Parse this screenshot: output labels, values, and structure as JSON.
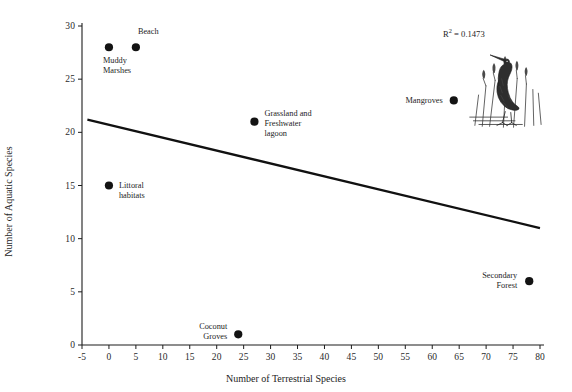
{
  "chart_data": {
    "type": "scatter",
    "title": "",
    "xlabel": "Number of Terrestrial Species",
    "ylabel": "Number of Aquatic Species",
    "xlim": [
      -5,
      80
    ],
    "ylim": [
      0,
      30
    ],
    "xticks": [
      -5,
      0,
      5,
      10,
      15,
      20,
      25,
      30,
      35,
      40,
      45,
      50,
      55,
      60,
      65,
      70,
      75,
      80
    ],
    "yticks": [
      0,
      5,
      10,
      15,
      20,
      25,
      30
    ],
    "grid": false,
    "legend": "none",
    "point_color": "#131313",
    "line_color": "#111111",
    "points": [
      {
        "label": "Muddy\nMarshes",
        "x": 0,
        "y": 28,
        "label_pos": "below-left",
        "label_dx": -6,
        "label_dy": 9,
        "align": "left"
      },
      {
        "label": "Beach",
        "x": 5,
        "y": 28,
        "label_pos": "above",
        "label_dx": 2,
        "label_dy": -20,
        "align": "left"
      },
      {
        "label": "Littoral\nhabitats",
        "x": 0,
        "y": 15,
        "label_pos": "right",
        "label_dx": 10,
        "label_dy": -5,
        "align": "left"
      },
      {
        "label": "Grassland and\nFreshwater\nlagoon",
        "x": 27,
        "y": 21,
        "label_pos": "right",
        "label_dx": 10,
        "label_dy": -13,
        "align": "left"
      },
      {
        "label": "Mangroves",
        "x": 64,
        "y": 23,
        "label_pos": "left",
        "label_dx": -11,
        "label_dy": -4,
        "align": "right"
      },
      {
        "label": "Secondary\nForest",
        "x": 78,
        "y": 6,
        "label_pos": "left",
        "label_dx": -12,
        "label_dy": -10,
        "align": "right"
      },
      {
        "label": "Coconut\nGroves",
        "x": 24,
        "y": 1,
        "label_pos": "left",
        "label_dx": -11,
        "label_dy": -12,
        "align": "right"
      }
    ],
    "trendline": {
      "x_start": -4,
      "y_start": 21.2,
      "x_end": 80,
      "y_end": 11.0
    },
    "annotations": [
      {
        "name": "r2-value",
        "text": "R",
        "sup": "2",
        "rest": " = 0.1473",
        "x": 62,
        "y": 29.3
      }
    ]
  },
  "annotation": {
    "r2_prefix": "R",
    "r2_exponent": "2",
    "r2_suffix": " = 0.1473"
  },
  "illustration": {
    "name": "heron-bird-illustration",
    "description": "Line drawing of a heron standing among reeds"
  }
}
